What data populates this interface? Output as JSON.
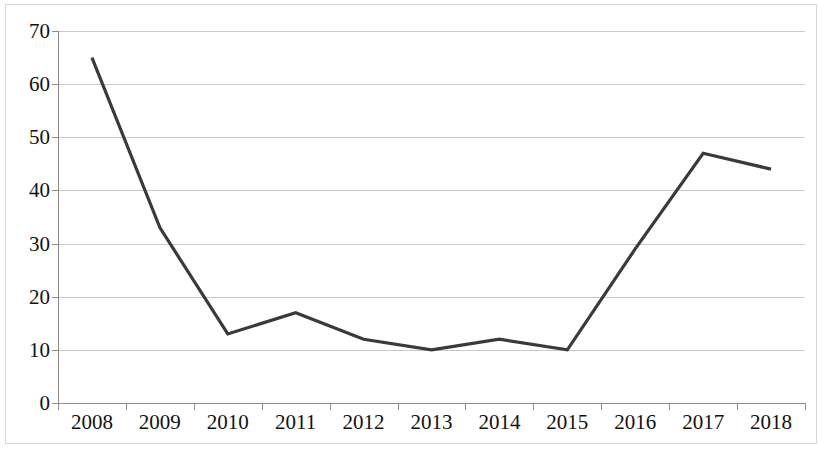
{
  "chart_data": {
    "type": "line",
    "title": "",
    "subtitle": "",
    "xlabel": "",
    "ylabel": "",
    "categories": [
      "2008",
      "2009",
      "2010",
      "2011",
      "2012",
      "2013",
      "2014",
      "2015",
      "2016",
      "2017",
      "2018"
    ],
    "values": [
      65,
      33,
      13,
      17,
      12,
      10,
      12,
      10,
      29,
      47,
      44
    ],
    "series": [
      {
        "name": "",
        "values": [
          65,
          33,
          13,
          17,
          12,
          10,
          12,
          10,
          29,
          47,
          44
        ]
      }
    ],
    "ylim": [
      0,
      70
    ],
    "ytick_values": [
      0,
      10,
      20,
      30,
      40,
      50,
      60,
      70
    ],
    "ytick_labels": [
      "0",
      "10",
      "20",
      "30",
      "40",
      "50",
      "60",
      "70"
    ],
    "xtick_labels": [
      "2008",
      "2009",
      "2010",
      "2011",
      "2012",
      "2013",
      "2014",
      "2015",
      "2016",
      "2017",
      "2018"
    ],
    "grid": true,
    "grid_axis": "y",
    "legend": false,
    "legend_position": "none",
    "annotations": [],
    "colors": {
      "line": "#3a3a3a",
      "gridline": "#c9c9c9",
      "axis": "#8c8c8c",
      "text": "#111111",
      "background": "#ffffff",
      "frame": "#d8d8d8"
    },
    "line_width": 3.2,
    "markers": false
  }
}
